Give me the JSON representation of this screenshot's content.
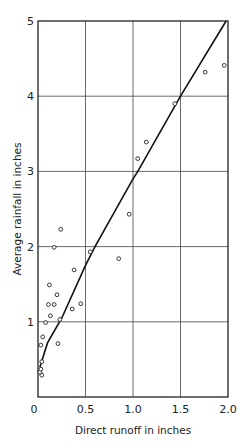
{
  "chart_data": {
    "type": "scatter",
    "title": "",
    "xlabel": "Direct runoff in inches",
    "ylabel": "Average rainfall in inches",
    "xlim": [
      0,
      2.0
    ],
    "ylim": [
      0,
      5
    ],
    "grid": true,
    "x_ticks": [
      "0",
      "0.5",
      "1.0",
      "1.5",
      "2.0"
    ],
    "x_tick_values": [
      0,
      0.5,
      1.0,
      1.5,
      2.0
    ],
    "y_ticks": [
      "1",
      "2",
      "3",
      "4",
      "5"
    ],
    "y_tick_values": [
      1,
      2,
      3,
      4,
      5
    ],
    "series": [
      {
        "name": "Observed storms",
        "kind": "scatter",
        "points": [
          [
            0.02,
            0.33
          ],
          [
            0.04,
            0.29
          ],
          [
            0.03,
            0.37
          ],
          [
            0.04,
            0.47
          ],
          [
            0.03,
            0.69
          ],
          [
            0.05,
            0.8
          ],
          [
            0.21,
            0.71
          ],
          [
            0.08,
            0.99
          ],
          [
            0.23,
            1.03
          ],
          [
            0.13,
            1.08
          ],
          [
            0.11,
            1.23
          ],
          [
            0.17,
            1.23
          ],
          [
            0.36,
            1.17
          ],
          [
            0.45,
            1.24
          ],
          [
            0.2,
            1.36
          ],
          [
            0.12,
            1.49
          ],
          [
            0.38,
            1.69
          ],
          [
            0.55,
            1.93
          ],
          [
            0.17,
            1.99
          ],
          [
            0.24,
            2.23
          ],
          [
            0.85,
            1.84
          ],
          [
            0.96,
            2.43
          ],
          [
            1.05,
            3.17
          ],
          [
            1.14,
            3.39
          ],
          [
            1.44,
            3.9
          ],
          [
            1.76,
            4.32
          ],
          [
            1.96,
            4.41
          ]
        ]
      },
      {
        "name": "Fitted curve",
        "kind": "line",
        "points": [
          [
            0.02,
            0.4
          ],
          [
            0.1,
            0.72
          ],
          [
            0.25,
            1.05
          ],
          [
            0.5,
            1.75
          ],
          [
            0.6,
            2.0
          ],
          [
            1.0,
            2.9
          ],
          [
            1.05,
            3.0
          ],
          [
            1.5,
            4.0
          ],
          [
            1.98,
            5.0
          ]
        ]
      }
    ]
  }
}
